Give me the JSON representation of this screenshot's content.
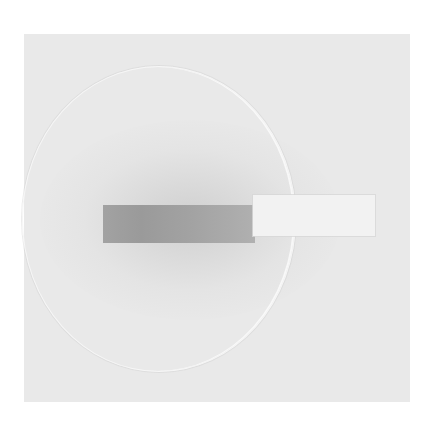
{
  "image": {
    "description": "Photograph of a circular Petri dish on a light gray background with a rectangular test strip laid horizontally across its center; the left portion of the strip is stained dark gray, the right portion is white and extends beyond the dish edge.",
    "colors": {
      "background": "#ffffff",
      "panel": "#e9e9e9",
      "dish_rim": "#f6f6f6",
      "strip_stained": "#9c9c9c",
      "strip_unstained": "#f2f2f2"
    },
    "objects": [
      {
        "name": "petri-dish",
        "shape": "circle"
      },
      {
        "name": "test-strip-stained-section",
        "shape": "rectangle"
      },
      {
        "name": "test-strip-unstained-section",
        "shape": "rectangle"
      }
    ]
  }
}
